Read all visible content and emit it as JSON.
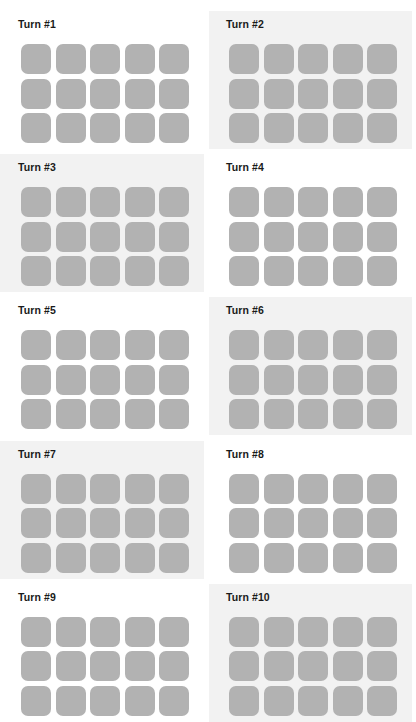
{
  "page": {
    "columns": 2,
    "rows": 5,
    "background_color": "#ffffff",
    "shaded_panel_color": "#f2f2f2",
    "cell_color": "#b2b2b2",
    "title_color": "#1a1a1a"
  },
  "panels": [
    {
      "label": "Turn #1",
      "shaded": false,
      "grid": {
        "cols": 5,
        "rows": 3,
        "cells": [
          "filled",
          "filled",
          "filled",
          "filled",
          "filled",
          "filled",
          "filled",
          "filled",
          "filled",
          "filled",
          "filled",
          "filled",
          "filled",
          "filled",
          "filled"
        ]
      }
    },
    {
      "label": "Turn #2",
      "shaded": true,
      "grid": {
        "cols": 5,
        "rows": 3,
        "cells": [
          "filled",
          "filled",
          "filled",
          "filled",
          "filled",
          "filled",
          "filled",
          "filled",
          "filled",
          "filled",
          "filled",
          "filled",
          "filled",
          "filled",
          "filled"
        ]
      }
    },
    {
      "label": "Turn #3",
      "shaded": true,
      "grid": {
        "cols": 5,
        "rows": 3,
        "cells": [
          "filled",
          "filled",
          "filled",
          "filled",
          "filled",
          "filled",
          "filled",
          "filled",
          "filled",
          "filled",
          "filled",
          "filled",
          "filled",
          "filled",
          "filled"
        ]
      }
    },
    {
      "label": "Turn #4",
      "shaded": false,
      "grid": {
        "cols": 5,
        "rows": 3,
        "cells": [
          "filled",
          "filled",
          "filled",
          "filled",
          "filled",
          "filled",
          "filled",
          "filled",
          "filled",
          "filled",
          "filled",
          "filled",
          "filled",
          "filled",
          "filled"
        ]
      }
    },
    {
      "label": "Turn #5",
      "shaded": false,
      "grid": {
        "cols": 5,
        "rows": 3,
        "cells": [
          "filled",
          "filled",
          "filled",
          "filled",
          "filled",
          "filled",
          "filled",
          "filled",
          "filled",
          "filled",
          "filled",
          "filled",
          "filled",
          "filled",
          "filled"
        ]
      }
    },
    {
      "label": "Turn #6",
      "shaded": true,
      "grid": {
        "cols": 5,
        "rows": 3,
        "cells": [
          "filled",
          "filled",
          "filled",
          "filled",
          "filled",
          "filled",
          "filled",
          "filled",
          "filled",
          "filled",
          "filled",
          "filled",
          "filled",
          "filled",
          "filled"
        ]
      }
    },
    {
      "label": "Turn #7",
      "shaded": true,
      "grid": {
        "cols": 5,
        "rows": 3,
        "cells": [
          "filled",
          "filled",
          "filled",
          "filled",
          "filled",
          "filled",
          "filled",
          "filled",
          "filled",
          "filled",
          "filled",
          "filled",
          "filled",
          "filled",
          "filled"
        ]
      }
    },
    {
      "label": "Turn #8",
      "shaded": false,
      "grid": {
        "cols": 5,
        "rows": 3,
        "cells": [
          "filled",
          "filled",
          "filled",
          "filled",
          "filled",
          "filled",
          "filled",
          "filled",
          "filled",
          "filled",
          "filled",
          "filled",
          "filled",
          "filled",
          "filled"
        ]
      }
    },
    {
      "label": "Turn #9",
      "shaded": false,
      "grid": {
        "cols": 5,
        "rows": 3,
        "cells": [
          "filled",
          "filled",
          "filled",
          "filled",
          "filled",
          "filled",
          "filled",
          "filled",
          "filled",
          "filled",
          "filled",
          "filled",
          "filled",
          "filled",
          "filled"
        ]
      }
    },
    {
      "label": "Turn #10",
      "shaded": true,
      "grid": {
        "cols": 5,
        "rows": 3,
        "cells": [
          "filled",
          "filled",
          "filled",
          "filled",
          "filled",
          "filled",
          "filled",
          "filled",
          "filled",
          "filled",
          "filled",
          "filled",
          "filled",
          "filled",
          "filled"
        ]
      }
    }
  ]
}
